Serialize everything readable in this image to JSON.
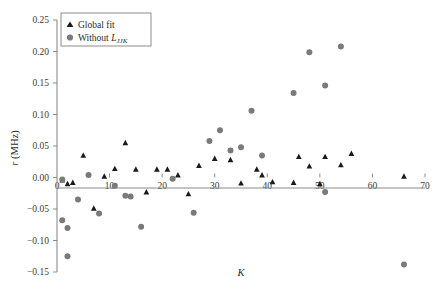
{
  "chart_data": {
    "type": "scatter",
    "title": "",
    "xlabel": "K",
    "ylabel": "r (MHz)",
    "ylabel_symbol": "r",
    "ylabel_unit": "(MHz)",
    "xlim": [
      0,
      70
    ],
    "ylim": [
      -0.15,
      0.25
    ],
    "xticks": [
      0,
      10,
      20,
      30,
      40,
      50,
      60,
      70
    ],
    "xtick_labels": [
      "0",
      "10",
      "20",
      "30",
      "40",
      "50",
      "60",
      "70"
    ],
    "yticks": [
      -0.15,
      -0.1,
      -0.05,
      0.0,
      0.05,
      0.1,
      0.15,
      0.2,
      0.25
    ],
    "ytick_labels": [
      "−0.15",
      "−0.10",
      "−0.05",
      "0.00",
      "0.05",
      "0.10",
      "0.15",
      "0.20",
      "0.25"
    ],
    "grid": false,
    "legend_position": "top-left",
    "series": [
      {
        "name": "Global fit",
        "marker": "triangle",
        "color": "#1a1a1a",
        "points": [
          {
            "x": 1,
            "y": -0.004
          },
          {
            "x": 2,
            "y": -0.01
          },
          {
            "x": 3,
            "y": -0.008
          },
          {
            "x": 5,
            "y": 0.035
          },
          {
            "x": 7,
            "y": -0.049
          },
          {
            "x": 9,
            "y": 0.002
          },
          {
            "x": 11,
            "y": 0.014
          },
          {
            "x": 13,
            "y": 0.055
          },
          {
            "x": 15,
            "y": 0.013
          },
          {
            "x": 17,
            "y": -0.023
          },
          {
            "x": 19,
            "y": 0.013
          },
          {
            "x": 21,
            "y": 0.013
          },
          {
            "x": 23,
            "y": 0.004
          },
          {
            "x": 25,
            "y": -0.026
          },
          {
            "x": 27,
            "y": 0.019
          },
          {
            "x": 30,
            "y": 0.03
          },
          {
            "x": 33,
            "y": 0.028
          },
          {
            "x": 35,
            "y": -0.009
          },
          {
            "x": 38,
            "y": 0.013
          },
          {
            "x": 39,
            "y": 0.004
          },
          {
            "x": 41,
            "y": -0.007
          },
          {
            "x": 45,
            "y": -0.008
          },
          {
            "x": 46,
            "y": 0.033
          },
          {
            "x": 48,
            "y": 0.018
          },
          {
            "x": 50,
            "y": -0.01
          },
          {
            "x": 51,
            "y": 0.033
          },
          {
            "x": 54,
            "y": 0.02
          },
          {
            "x": 56,
            "y": 0.038
          },
          {
            "x": 66,
            "y": 0.002
          }
        ]
      },
      {
        "name": "Without L_JJK",
        "marker": "circle",
        "color": "#7a7a7a",
        "points": [
          {
            "x": 1,
            "y": -0.003
          },
          {
            "x": 1,
            "y": -0.068
          },
          {
            "x": 2,
            "y": -0.08
          },
          {
            "x": 2,
            "y": -0.125
          },
          {
            "x": 4,
            "y": -0.035
          },
          {
            "x": 6,
            "y": 0.004
          },
          {
            "x": 8,
            "y": -0.057
          },
          {
            "x": 11,
            "y": -0.013
          },
          {
            "x": 13,
            "y": -0.029
          },
          {
            "x": 14,
            "y": -0.03
          },
          {
            "x": 16,
            "y": -0.078
          },
          {
            "x": 22,
            "y": -0.002
          },
          {
            "x": 26,
            "y": -0.056
          },
          {
            "x": 29,
            "y": 0.058
          },
          {
            "x": 31,
            "y": 0.075
          },
          {
            "x": 33,
            "y": 0.043
          },
          {
            "x": 35,
            "y": 0.048
          },
          {
            "x": 37,
            "y": 0.106
          },
          {
            "x": 39,
            "y": 0.035
          },
          {
            "x": 45,
            "y": 0.134
          },
          {
            "x": 48,
            "y": 0.199
          },
          {
            "x": 51,
            "y": 0.146
          },
          {
            "x": 51,
            "y": -0.023
          },
          {
            "x": 54,
            "y": 0.208
          },
          {
            "x": 66,
            "y": -0.138
          }
        ]
      }
    ]
  },
  "legend": {
    "items": [
      {
        "label": "Global fit",
        "marker": "triangle",
        "color": "#1a1a1a"
      },
      {
        "label": "Without ",
        "symbol": "L",
        "sub": "JJK",
        "marker": "circle",
        "color": "#7a7a7a"
      }
    ]
  }
}
